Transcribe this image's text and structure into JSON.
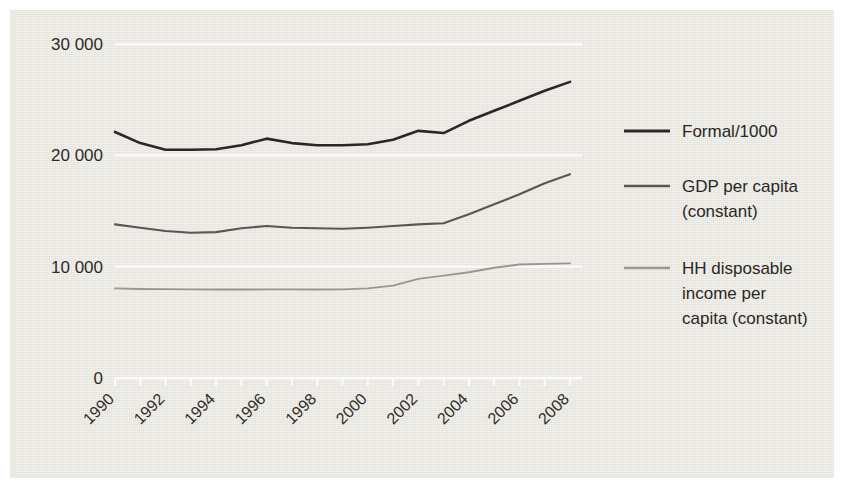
{
  "chart_data": {
    "type": "line",
    "title": "",
    "subtitle": "",
    "xlabel": "",
    "ylabel": "",
    "x": [
      1990,
      1991,
      1992,
      1993,
      1994,
      1995,
      1996,
      1997,
      1998,
      1999,
      2000,
      2001,
      2002,
      2003,
      2004,
      2005,
      2006,
      2007,
      2008
    ],
    "xtick_labels": [
      "1990",
      "1992",
      "1994",
      "1996",
      "1998",
      "2000",
      "2002",
      "2004",
      "2006",
      "2008"
    ],
    "xlim": [
      1990,
      2008
    ],
    "ylim": [
      0,
      30000
    ],
    "ytick_labels": [
      "0",
      "10 000",
      "20 000",
      "30 000"
    ],
    "ytick_values": [
      0,
      10000,
      20000,
      30000
    ],
    "grid": true,
    "grid_color": "#fbfaf7",
    "legend_position": "right",
    "background_color": "#e8e6df",
    "series": [
      {
        "name": "Formal/1000",
        "color": "#2a2724",
        "width": 2.6,
        "values": [
          22100,
          21100,
          20500,
          20500,
          20550,
          20900,
          21500,
          21100,
          20900,
          20900,
          21000,
          21400,
          22200,
          22000,
          23100,
          24000,
          24900,
          25800,
          26600
        ]
      },
      {
        "name": "GDP per capita (constant)",
        "color": "#5a5752",
        "width": 2.1,
        "values": [
          13800,
          13500,
          13200,
          13050,
          13100,
          13450,
          13650,
          13500,
          13450,
          13400,
          13500,
          13650,
          13800,
          13900,
          14700,
          15600,
          16500,
          17500,
          18300
        ]
      },
      {
        "name": "HH disposable income per capita (constant)",
        "color": "#9a9790",
        "width": 1.9,
        "values": [
          8050,
          8000,
          7980,
          7960,
          7950,
          7950,
          7960,
          7960,
          7950,
          7960,
          8050,
          8300,
          8900,
          9200,
          9500,
          9900,
          10200,
          10250,
          10300
        ]
      }
    ]
  },
  "legend": {
    "entries": [
      {
        "label": "Formal/1000",
        "lines": [
          "Formal/1000"
        ],
        "color": "#2a2724"
      },
      {
        "label": "GDP per capita (constant)",
        "lines": [
          "GDP per capita",
          "(constant)"
        ],
        "color": "#5a5752"
      },
      {
        "label": "HH disposable income per capita (constant)",
        "lines": [
          "HH disposable",
          "income per",
          "capita (constant)"
        ],
        "color": "#9a9790"
      }
    ]
  }
}
